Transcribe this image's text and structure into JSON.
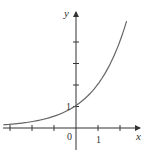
{
  "chart_data": {
    "type": "line",
    "title": "",
    "function": "y = 2^x",
    "xlabel": "x",
    "ylabel": "y",
    "xlim": [
      -3.3,
      2.3
    ],
    "ylim": [
      -0.8,
      5.2
    ],
    "x_ticks": [
      -3,
      -2,
      -1,
      0,
      1,
      2
    ],
    "y_ticks": [
      1,
      2,
      3,
      4
    ],
    "tick_labels": {
      "x": [
        "0",
        "1"
      ],
      "y": [
        "1"
      ]
    },
    "grid": false,
    "legend": null,
    "series": [
      {
        "name": "y = 2^x",
        "x": [
          -3.3,
          -3,
          -2,
          -1,
          0,
          1,
          2,
          2.3
        ],
        "y": [
          0.1,
          0.125,
          0.25,
          0.5,
          1,
          2,
          4,
          4.92
        ]
      }
    ]
  },
  "labels": {
    "x_axis": "x",
    "y_axis": "y",
    "origin": "0",
    "x_one": "1",
    "y_one": "1"
  },
  "colors": {
    "axis": "#333333",
    "curve": "#555555"
  }
}
